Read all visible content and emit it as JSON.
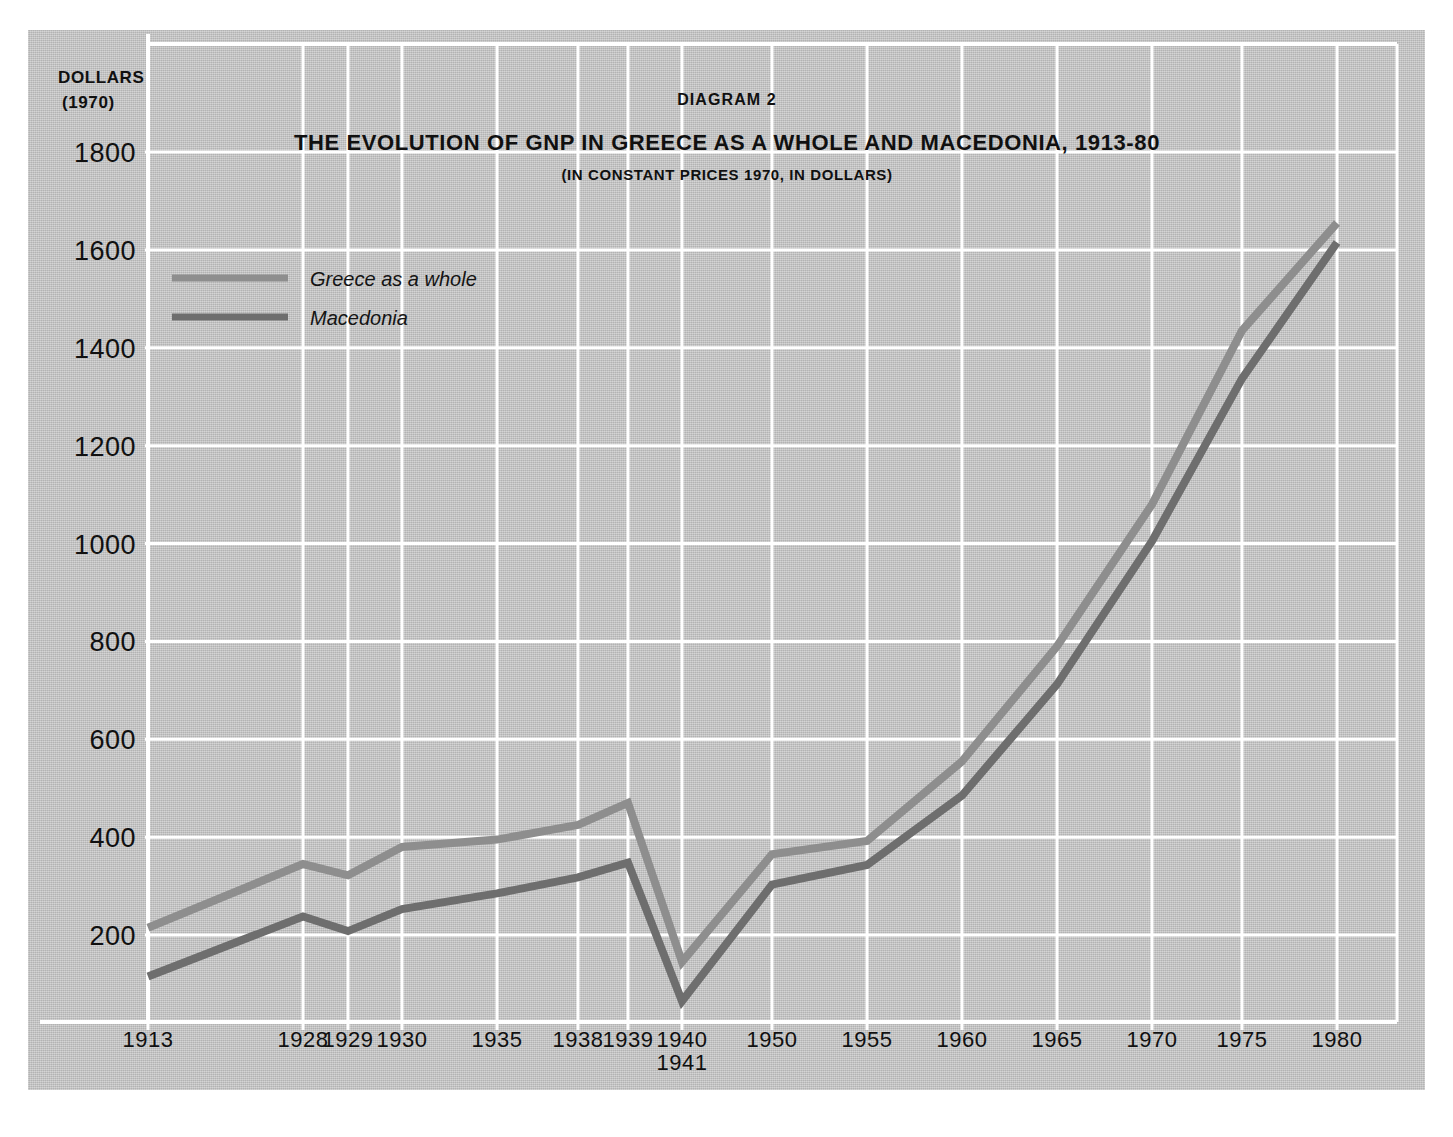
{
  "figure": {
    "diagram_label": "DIAGRAM 2",
    "title": "THE EVOLUTION OF GNP IN GREECE AS A WHOLE AND MACEDONIA, 1913-80",
    "subtitle": "(IN CONSTANT PRICES 1970, IN DOLLARS)",
    "unit_line1": "DOLLARS",
    "unit_line2": "(1970)",
    "x_extra_label": "1941"
  },
  "legend": {
    "position": "upper-left-inside",
    "entries": [
      {
        "label": "Greece as a whole",
        "color": "#8e8e8e"
      },
      {
        "label": "Macedonia",
        "color": "#6e6e6e"
      }
    ]
  },
  "colors": {
    "background": "#c4c4c4",
    "gridline": "#ffffff",
    "greece": "#8e8e8e",
    "macedonia": "#6e6e6e",
    "text": "#101010"
  },
  "chart_data": {
    "type": "line",
    "title": "THE EVOLUTION OF GNP IN GREECE AS A WHOLE AND MACEDONIA, 1913-80",
    "subtitle": "(IN CONSTANT PRICES 1970, IN DOLLARS)",
    "xlabel": "",
    "ylabel": "DOLLARS (1970)",
    "ylim": [
      0,
      1900
    ],
    "yticks": [
      200,
      400,
      600,
      800,
      1000,
      1200,
      1400,
      1600,
      1800
    ],
    "ytick_labels": [
      "200",
      "400",
      "600",
      "800",
      "1000",
      "1200",
      "1400",
      "1600",
      "1800"
    ],
    "categories": [
      "1913",
      "1928",
      "1929",
      "1930",
      "1935",
      "1938",
      "1939",
      "1940",
      "1950",
      "1955",
      "1960",
      "1965",
      "1970",
      "1975",
      "1980"
    ],
    "xtick_labels": [
      "1913",
      "1928",
      "1929",
      "1930",
      "1935",
      "1938",
      "1939",
      "1940\n1941",
      "1950",
      "1955",
      "1960",
      "1965",
      "1970",
      "1975",
      "1980"
    ],
    "grid": true,
    "legend_position": "upper left",
    "series": [
      {
        "name": "Greece as a whole",
        "color": "#8e8e8e",
        "values": [
          215,
          345,
          322,
          380,
          395,
          425,
          470,
          145,
          365,
          392,
          555,
          790,
          1080,
          1435,
          1655
        ]
      },
      {
        "name": "Macedonia",
        "color": "#6e6e6e",
        "values": [
          115,
          238,
          208,
          253,
          285,
          318,
          348,
          65,
          303,
          343,
          485,
          712,
          1005,
          1337,
          1615
        ]
      }
    ]
  }
}
